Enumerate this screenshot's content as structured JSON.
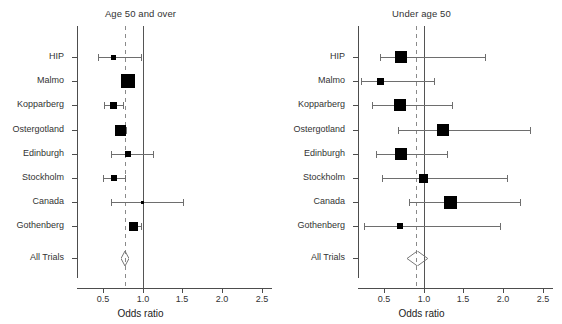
{
  "figure": {
    "type": "forest-plot",
    "n_panels": 2,
    "shared_xlabel": "Odds ratio",
    "colors": {
      "marker": "#000000",
      "ci_line": "#6e6e6e",
      "null_line": "#555555",
      "pooled_line": "#8a8a8a",
      "axis": "#4d4d4d",
      "text": "#333333",
      "background": "#ffffff"
    }
  },
  "chart_data": [
    {
      "type": "forest",
      "panel_id": "age-50-and-over",
      "title": "Age 50 and over",
      "xlabel": "Odds ratio",
      "ylabel": "",
      "xlim": [
        0.18,
        2.62
      ],
      "xticks": [
        0.5,
        1.0,
        1.5,
        2.0,
        2.5
      ],
      "xticklabels": [
        "0.5",
        "1.0",
        "1.5",
        "2.0",
        "2.5"
      ],
      "grid": false,
      "null_line": 1.0,
      "pooled_line": 0.78,
      "categories": [
        "HIP",
        "Malmo",
        "Kopparberg",
        "Ostergotland",
        "Edinburgh",
        "Stockholm",
        "Canada",
        "Gothenberg",
        "All Trials"
      ],
      "rows": [
        {
          "label": "HIP",
          "or": 0.64,
          "lcl": 0.44,
          "ucl": 0.98,
          "weight": 0.22,
          "summary": false
        },
        {
          "label": "Malmo",
          "or": 0.82,
          "lcl": 0.78,
          "ucl": 0.86,
          "weight": 1.0,
          "summary": false
        },
        {
          "label": "Kopparberg",
          "or": 0.64,
          "lcl": 0.52,
          "ucl": 0.76,
          "weight": 0.34,
          "summary": false
        },
        {
          "label": "Ostergotland",
          "or": 0.72,
          "lcl": 0.68,
          "ucl": 0.79,
          "weight": 0.72,
          "summary": false
        },
        {
          "label": "Edinburgh",
          "or": 0.82,
          "lcl": 0.6,
          "ucl": 1.13,
          "weight": 0.24,
          "summary": false
        },
        {
          "label": "Stockholm",
          "or": 0.64,
          "lcl": 0.5,
          "ucl": 0.78,
          "weight": 0.26,
          "summary": false
        },
        {
          "label": "Canada",
          "or": 1.0,
          "lcl": 0.61,
          "ucl": 1.51,
          "weight": 0.02,
          "summary": false
        },
        {
          "label": "Gothenberg",
          "or": 0.89,
          "lcl": 0.83,
          "ucl": 0.98,
          "weight": 0.58,
          "summary": false
        },
        {
          "label": "All Trials",
          "or": 0.78,
          "lcl": 0.75,
          "ucl": 0.81,
          "weight": 0.0,
          "summary": true
        }
      ]
    },
    {
      "type": "forest",
      "panel_id": "under-age-50",
      "title": "Under age 50",
      "xlabel": "Odds ratio",
      "ylabel": "",
      "xlim": [
        0.18,
        2.62
      ],
      "xticks": [
        0.5,
        1.0,
        1.5,
        2.0,
        2.5
      ],
      "xticklabels": [
        "0.5",
        "1.0",
        "1.5",
        "2.0",
        "2.5"
      ],
      "grid": false,
      "null_line": 1.0,
      "pooled_line": 0.9,
      "categories": [
        "HIP",
        "Malmo",
        "Kopparberg",
        "Ostergotland",
        "Edinburgh",
        "Stockholm",
        "Canada",
        "Gothenberg",
        "All Trials"
      ],
      "rows": [
        {
          "label": "HIP",
          "or": 0.72,
          "lcl": 0.45,
          "ucl": 1.77,
          "weight": 0.8,
          "summary": false
        },
        {
          "label": "Malmo",
          "or": 0.46,
          "lcl": 0.22,
          "ucl": 1.13,
          "weight": 0.4,
          "summary": false
        },
        {
          "label": "Kopparberg",
          "or": 0.7,
          "lcl": 0.36,
          "ucl": 1.36,
          "weight": 0.82,
          "summary": false
        },
        {
          "label": "Ostergotland",
          "or": 1.24,
          "lcl": 0.68,
          "ucl": 2.33,
          "weight": 0.84,
          "summary": false
        },
        {
          "label": "Edinburgh",
          "or": 0.72,
          "lcl": 0.4,
          "ucl": 1.29,
          "weight": 0.86,
          "summary": false
        },
        {
          "label": "Stockholm",
          "or": 1.0,
          "lcl": 0.48,
          "ucl": 2.05,
          "weight": 0.56,
          "summary": false
        },
        {
          "label": "Canada",
          "or": 1.34,
          "lcl": 0.82,
          "ucl": 2.21,
          "weight": 0.92,
          "summary": false
        },
        {
          "label": "Gothenberg",
          "or": 0.7,
          "lcl": 0.26,
          "ucl": 1.96,
          "weight": 0.3,
          "summary": false
        },
        {
          "label": "All Trials",
          "or": 0.92,
          "lcl": 0.8,
          "ucl": 1.06,
          "weight": 0.0,
          "summary": true
        }
      ]
    }
  ]
}
